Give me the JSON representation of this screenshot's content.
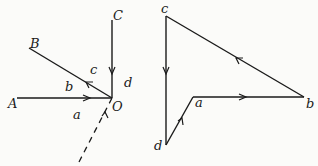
{
  "space_diagram": {
    "point_labels": {
      "A": "A",
      "B": "B",
      "C": "C",
      "O": "O"
    },
    "segment_labels": {
      "a": "a",
      "b": "b",
      "c": "c",
      "d": "d"
    }
  },
  "force_polygon": {
    "point_labels": {
      "a": "a",
      "b": "b",
      "c": "c",
      "d": "d"
    }
  }
}
